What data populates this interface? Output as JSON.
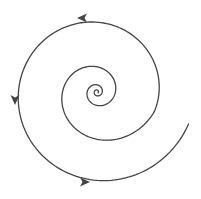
{
  "diagram": {
    "type": "spiral phase portrait",
    "center": [
      97,
      92
    ],
    "stroke_color": "#444444",
    "background": "#ffffff",
    "spiral": {
      "start_radius": 97,
      "start_angle": 0.33,
      "decay": 0.075,
      "inner_decay": 0.2,
      "turns": 7
    },
    "arrows": [
      {
        "name": "top-arrow",
        "x": 82,
        "y": 18,
        "direction": "left"
      },
      {
        "name": "left-arrow",
        "x": 15,
        "y": 100,
        "direction": "down"
      },
      {
        "name": "bottom-arrow",
        "x": 85,
        "y": 182,
        "direction": "right"
      }
    ]
  }
}
